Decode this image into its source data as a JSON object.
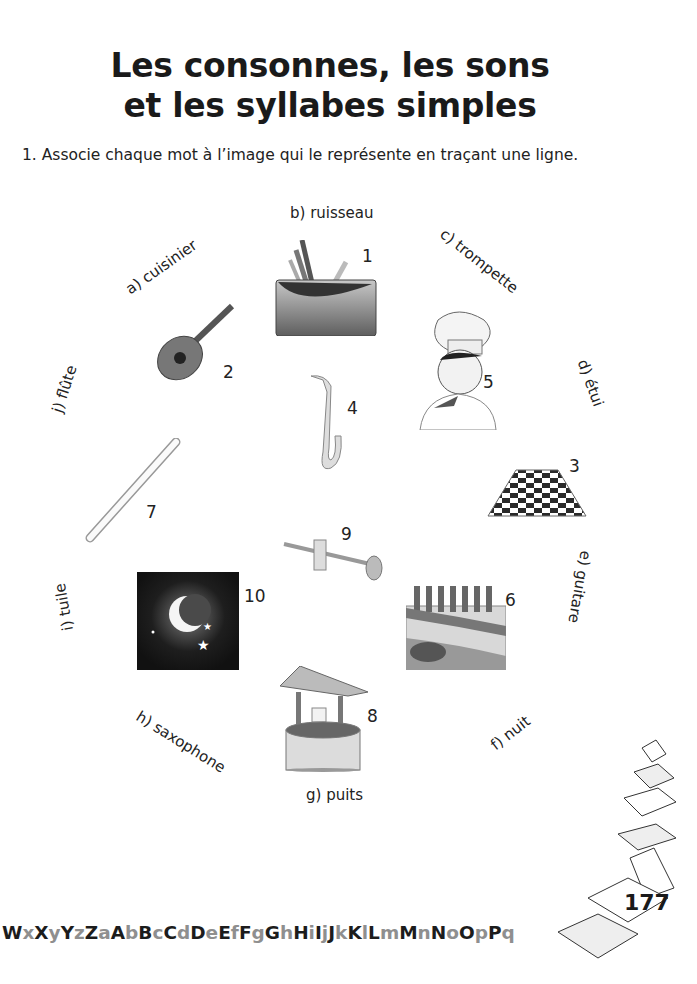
{
  "page": {
    "title_line1": "Les consonnes, les sons",
    "title_line2": "et les syllabes simples",
    "instruction": "1. Associe chaque mot à l’image qui le représente en traçant une ligne.",
    "page_number": "177"
  },
  "words": [
    {
      "id": "a",
      "label": "a) cuisinier"
    },
    {
      "id": "b",
      "label": "b) ruisseau"
    },
    {
      "id": "c",
      "label": "c) trompette"
    },
    {
      "id": "d",
      "label": "d) étui"
    },
    {
      "id": "e",
      "label": "e) guitare"
    },
    {
      "id": "f",
      "label": "f) nuit"
    },
    {
      "id": "g",
      "label": "g) puits"
    },
    {
      "id": "h",
      "label": "h) saxophone"
    },
    {
      "id": "i",
      "label": "i) tuile"
    },
    {
      "id": "j",
      "label": "j) flûte"
    }
  ],
  "pictures": [
    {
      "num": "1",
      "subject": "pencil-case"
    },
    {
      "num": "2",
      "subject": "guitar"
    },
    {
      "num": "3",
      "subject": "checkered-tile-floor"
    },
    {
      "num": "4",
      "subject": "saxophone"
    },
    {
      "num": "5",
      "subject": "chef"
    },
    {
      "num": "6",
      "subject": "stream"
    },
    {
      "num": "7",
      "subject": "recorder-flute"
    },
    {
      "num": "8",
      "subject": "well"
    },
    {
      "num": "9",
      "subject": "trumpet"
    },
    {
      "num": "10",
      "subject": "night-moon"
    }
  ],
  "alphabet_vertical": [
    [
      "Y",
      "t"
    ],
    [
      "z",
      "g"
    ],
    [
      "Z",
      "t"
    ],
    [
      " ",
      "t"
    ],
    [
      "a",
      "g"
    ],
    [
      "A",
      "t"
    ],
    [
      "b",
      "g"
    ],
    [
      "B",
      "t"
    ],
    [
      "c",
      "g"
    ],
    [
      "C",
      "t"
    ],
    [
      "d",
      "g"
    ],
    [
      "D",
      "t"
    ],
    [
      "e",
      "g"
    ],
    [
      "E",
      "t"
    ],
    [
      "f",
      "g"
    ],
    [
      "F",
      "t"
    ],
    [
      "g",
      "g"
    ],
    [
      "G",
      "t"
    ],
    [
      "h",
      "g"
    ],
    [
      "H",
      "t"
    ],
    [
      "i",
      "g"
    ],
    [
      "I",
      "t"
    ],
    [
      "j",
      "g"
    ],
    [
      "J",
      "t"
    ],
    [
      "k",
      "g"
    ],
    [
      "K",
      "t"
    ],
    [
      "l",
      "g"
    ],
    [
      "L",
      "t"
    ],
    [
      "m",
      "g"
    ],
    [
      "M",
      "t"
    ],
    [
      "n",
      "g"
    ],
    [
      "N",
      "t"
    ],
    [
      "o",
      "g"
    ],
    [
      "O",
      "t"
    ],
    [
      "p",
      "g"
    ],
    [
      "P",
      "t"
    ],
    [
      "q",
      "g"
    ],
    [
      "Q",
      "t"
    ],
    [
      "r",
      "g"
    ],
    [
      "R",
      "t"
    ],
    [
      "s",
      "g"
    ],
    [
      "S",
      "t"
    ],
    [
      "t",
      "g"
    ],
    [
      "T",
      "t"
    ],
    [
      "u",
      "g"
    ],
    [
      "U",
      "t"
    ],
    [
      "v",
      "g"
    ],
    [
      "V",
      "t"
    ],
    [
      "w",
      "g"
    ],
    [
      "W",
      "t"
    ],
    [
      "x",
      "g"
    ],
    [
      "X",
      "t"
    ]
  ],
  "alphabet_horizontal": [
    [
      "W",
      "t"
    ],
    [
      "x",
      "g"
    ],
    [
      "X",
      "t"
    ],
    [
      "y",
      "g"
    ],
    [
      "Y",
      "t"
    ],
    [
      "z",
      "g"
    ],
    [
      "Z",
      "t"
    ],
    [
      "a",
      "g"
    ],
    [
      "A",
      "t"
    ],
    [
      "b",
      "g"
    ],
    [
      "B",
      "t"
    ],
    [
      "c",
      "g"
    ],
    [
      "C",
      "t"
    ],
    [
      "d",
      "g"
    ],
    [
      "D",
      "t"
    ],
    [
      "e",
      "g"
    ],
    [
      "E",
      "t"
    ],
    [
      "f",
      "g"
    ],
    [
      "F",
      "t"
    ],
    [
      "g",
      "g"
    ],
    [
      "G",
      "t"
    ],
    [
      "h",
      "g"
    ],
    [
      "H",
      "t"
    ],
    [
      "i",
      "g"
    ],
    [
      "I",
      "t"
    ],
    [
      "j",
      "g"
    ],
    [
      "J",
      "t"
    ],
    [
      "k",
      "g"
    ],
    [
      "K",
      "t"
    ],
    [
      "l",
      "g"
    ],
    [
      "L",
      "t"
    ],
    [
      "m",
      "g"
    ],
    [
      "M",
      "t"
    ],
    [
      "n",
      "g"
    ],
    [
      "N",
      "t"
    ],
    [
      "o",
      "g"
    ],
    [
      "O",
      "t"
    ],
    [
      "p",
      "g"
    ],
    [
      "P",
      "t"
    ],
    [
      "q",
      "g"
    ]
  ],
  "colors": {
    "text_dark": "#1c1c1c",
    "text_grey": "#8f8f8f"
  }
}
